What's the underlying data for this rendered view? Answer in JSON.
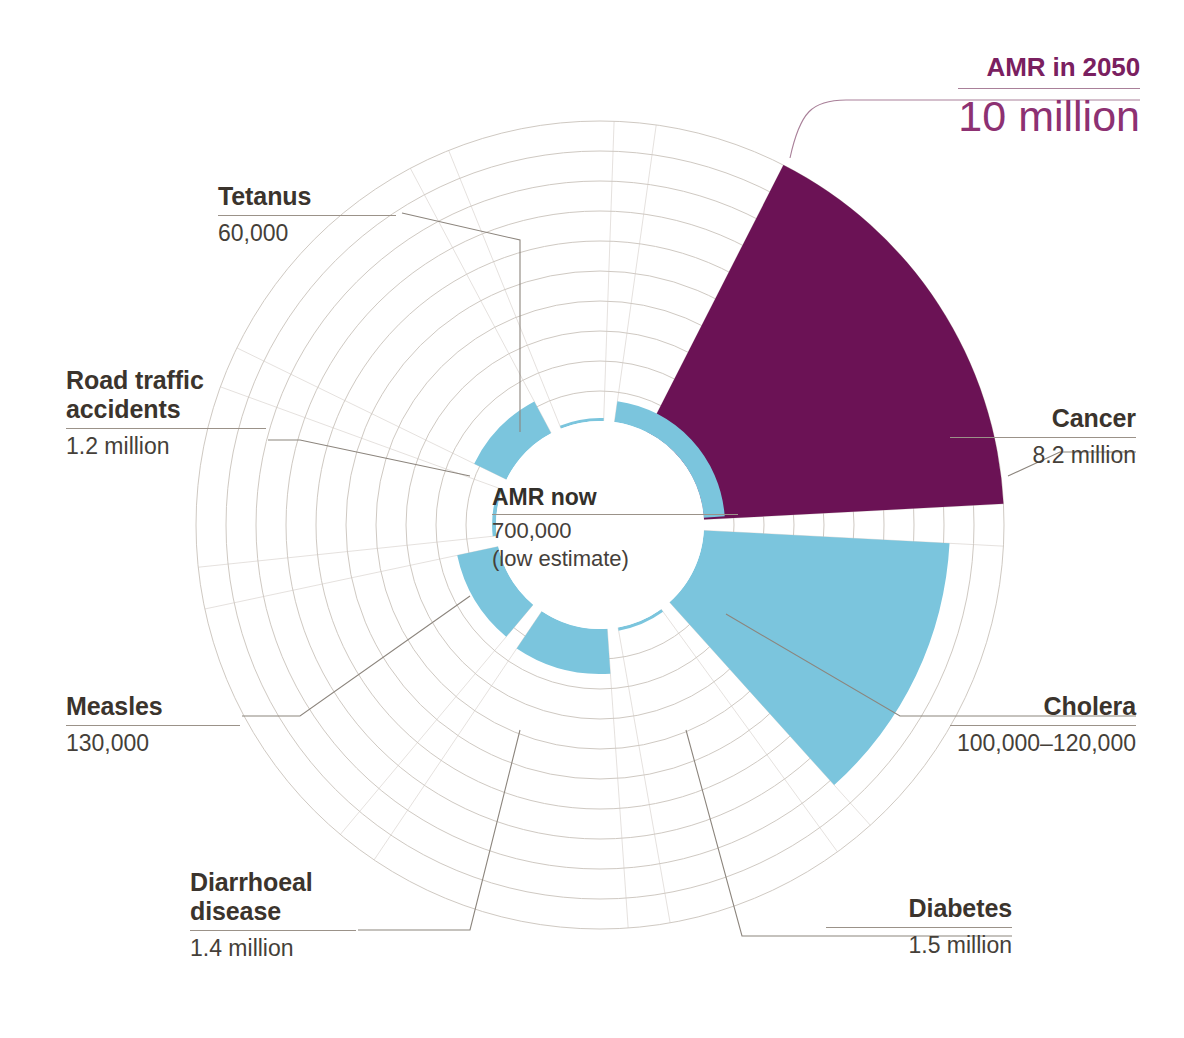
{
  "figure": {
    "colors": {
      "amr_purple": "#6b1255",
      "disease_blue": "#7bc5dd",
      "gridline": "#cfc9c2",
      "leader": "#8c857d",
      "label_text": "#3b342d",
      "purple_text": "#7a2060",
      "background": "#ffffff"
    }
  },
  "center": {
    "title": "AMR now",
    "value": "700,000",
    "note": "(low estimate)"
  },
  "callout_2050": {
    "title": "AMR in 2050",
    "value": "10 million"
  },
  "labels": {
    "tetanus": {
      "title": "Tetanus",
      "value": "60,000"
    },
    "road": {
      "title": "Road traffic accidents",
      "value": "1.2 million"
    },
    "measles": {
      "title": "Measles",
      "value": "130,000"
    },
    "diarrhoeal": {
      "title": "Diarrhoeal disease",
      "value": "1.4 million"
    },
    "diabetes": {
      "title": "Diabetes",
      "value": "1.5 million"
    },
    "cholera": {
      "title": "Cholera",
      "value": "100,000–120,000"
    },
    "cancer": {
      "title": "Cancer",
      "value": "8.2 million"
    }
  },
  "chart_data": {
    "type": "pie",
    "subtype": "radial-sector / polar-area chart",
    "units": "deaths per year",
    "center_label": "AMR now 700,000 (low estimate)",
    "grid": true,
    "grid_rings": 10,
    "legend": "none (direct labels)",
    "radial_scale_max_millions": 10,
    "slices": [
      {
        "name": "AMR in 2050",
        "value_text": "10 million",
        "value_millions": 10.0,
        "color": "#6b1255",
        "start_angle_deg": -63,
        "end_angle_deg": -3,
        "label_position": "top-right"
      },
      {
        "name": "Cancer",
        "value_text": "8.2 million",
        "value_millions": 8.2,
        "color": "#7bc5dd",
        "start_angle_deg": 3,
        "end_angle_deg": 48,
        "label_position": "right"
      },
      {
        "name": "Cholera",
        "value_text": "100,000–120,000",
        "value_millions": 0.11,
        "color": "#7bc5dd",
        "start_angle_deg": 54,
        "end_angle_deg": 80,
        "label_position": "lower-right"
      },
      {
        "name": "Diabetes",
        "value_text": "1.5 million",
        "value_millions": 1.5,
        "color": "#7bc5dd",
        "start_angle_deg": 86,
        "end_angle_deg": 124,
        "label_position": "bottom-right"
      },
      {
        "name": "Diarrhoeal disease",
        "value_text": "1.4 million",
        "value_millions": 1.4,
        "color": "#7bc5dd",
        "start_angle_deg": 130,
        "end_angle_deg": 168,
        "label_position": "bottom-left"
      },
      {
        "name": "Measles",
        "value_text": "130,000",
        "value_millions": 0.13,
        "color": "#7bc5dd",
        "start_angle_deg": 174,
        "end_angle_deg": 200,
        "label_position": "left"
      },
      {
        "name": "Road traffic accidents",
        "value_text": "1.2 million",
        "value_millions": 1.2,
        "color": "#7bc5dd",
        "start_angle_deg": 206,
        "end_angle_deg": 242,
        "label_position": "upper-left"
      },
      {
        "name": "Tetanus",
        "value_text": "60,000",
        "value_millions": 0.06,
        "color": "#7bc5dd",
        "start_angle_deg": 248,
        "end_angle_deg": 272,
        "label_position": "top-left"
      },
      {
        "name": "AMR now",
        "value_text": "700,000",
        "value_millions": 0.7,
        "color": "#7bc5dd",
        "start_angle_deg": 278,
        "end_angle_deg": 356,
        "label_position": "center"
      }
    ]
  }
}
